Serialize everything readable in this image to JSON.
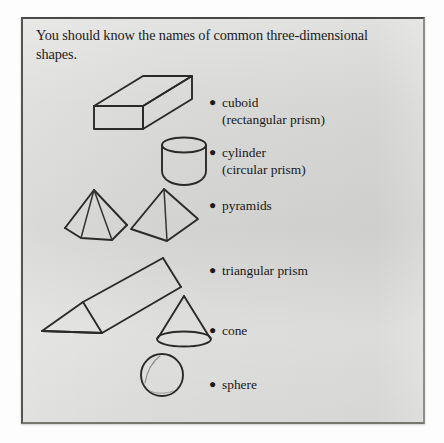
{
  "page": {
    "heading": "You should know the names of common three-dimensional shapes.",
    "bullet_glyph": "●",
    "ink_color": "#2a2a2a",
    "panel_background": "#d7d7d5"
  },
  "shape_entries": [
    {
      "name": "cuboid",
      "label": "cuboid",
      "sublabel": "(rectangular prism)",
      "figure": "cuboid-oblique-slab"
    },
    {
      "name": "cylinder",
      "label": "cylinder",
      "sublabel": "(circular prism)",
      "figure": "cylinder-with-elliptical-top"
    },
    {
      "name": "pyramids",
      "label": "pyramids",
      "sublabel": "",
      "figure": "hexagonal-pyramid-and-square-pyramid"
    },
    {
      "name": "triangular-prism",
      "label": "triangular prism",
      "sublabel": "",
      "figure": "tilted-triangular-prism"
    },
    {
      "name": "cone",
      "label": "cone",
      "sublabel": "",
      "figure": "cone-with-elliptical-base"
    },
    {
      "name": "sphere",
      "label": "sphere",
      "sublabel": "",
      "figure": "sphere-circle"
    }
  ]
}
